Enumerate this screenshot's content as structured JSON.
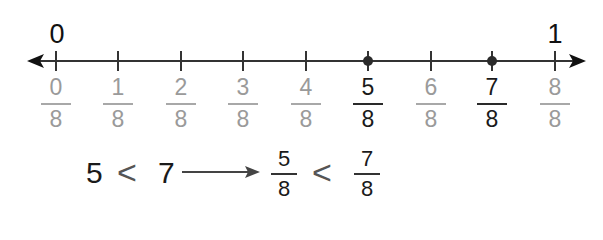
{
  "number_line": {
    "start_label": "0",
    "end_label": "1",
    "ticks": [
      {
        "num": "0",
        "den": "8",
        "highlight": false,
        "point": false,
        "x": 56
      },
      {
        "num": "1",
        "den": "8",
        "highlight": false,
        "point": false,
        "x": 118
      },
      {
        "num": "2",
        "den": "8",
        "highlight": false,
        "point": false,
        "x": 181
      },
      {
        "num": "3",
        "den": "8",
        "highlight": false,
        "point": false,
        "x": 243
      },
      {
        "num": "4",
        "den": "8",
        "highlight": false,
        "point": false,
        "x": 306
      },
      {
        "num": "5",
        "den": "8",
        "highlight": true,
        "point": true,
        "x": 368
      },
      {
        "num": "6",
        "den": "8",
        "highlight": false,
        "point": false,
        "x": 431
      },
      {
        "num": "7",
        "den": "8",
        "highlight": true,
        "point": true,
        "x": 492
      },
      {
        "num": "8",
        "den": "8",
        "highlight": false,
        "point": false,
        "x": 555
      }
    ],
    "colors": {
      "line": "#333333",
      "highlight_text": "#1a1a1a",
      "muted_text": "#9a9a9a",
      "point": "#2b2b2b"
    }
  },
  "comparison": {
    "left_a": "5",
    "op1": "<",
    "left_b": "7",
    "frac_a": {
      "num": "5",
      "den": "8"
    },
    "op2": "<",
    "frac_b": {
      "num": "7",
      "den": "8"
    }
  }
}
